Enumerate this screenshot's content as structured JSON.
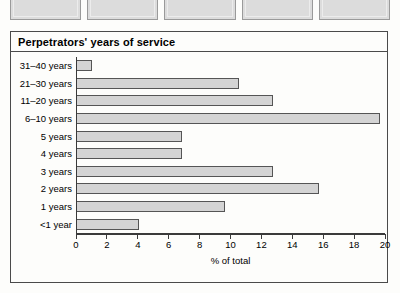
{
  "thumbnails": {
    "count": 5,
    "items": [
      {
        "label": ""
      },
      {
        "label": ""
      },
      {
        "label": ""
      },
      {
        "label": ""
      },
      {
        "label": ""
      }
    ]
  },
  "panel": {
    "title": "Perpetrators' years of service"
  },
  "colors": {
    "bar_fill": "#d4d4d4",
    "bar_border": "#555555",
    "axis": "#3a3a3a",
    "panel_border": "#4a4a4a",
    "background": "#fdfdfb",
    "thumbnail_fill": "#dcdcdc"
  },
  "chart_data": {
    "type": "bar",
    "orientation": "horizontal",
    "title": "Perpetrators' years of service",
    "xlabel": "% of total",
    "ylabel": "",
    "categories": [
      "31–40 years",
      "21–30 years",
      "11–20 years",
      "6–10 years",
      "5 years",
      "4 years",
      "3 years",
      "2 years",
      "1 years",
      "<1 year"
    ],
    "values": [
      1.0,
      10.5,
      12.7,
      19.7,
      6.8,
      6.8,
      12.7,
      15.7,
      9.6,
      4.0
    ],
    "xlim": [
      0,
      20
    ],
    "xticks": [
      0,
      2,
      4,
      6,
      8,
      10,
      12,
      14,
      16,
      18,
      20
    ],
    "xtick_labels": [
      "0",
      "2",
      "4",
      "6",
      "8",
      "10",
      "12",
      "14",
      "16",
      "18",
      "20"
    ],
    "grid": false,
    "legend": false
  }
}
